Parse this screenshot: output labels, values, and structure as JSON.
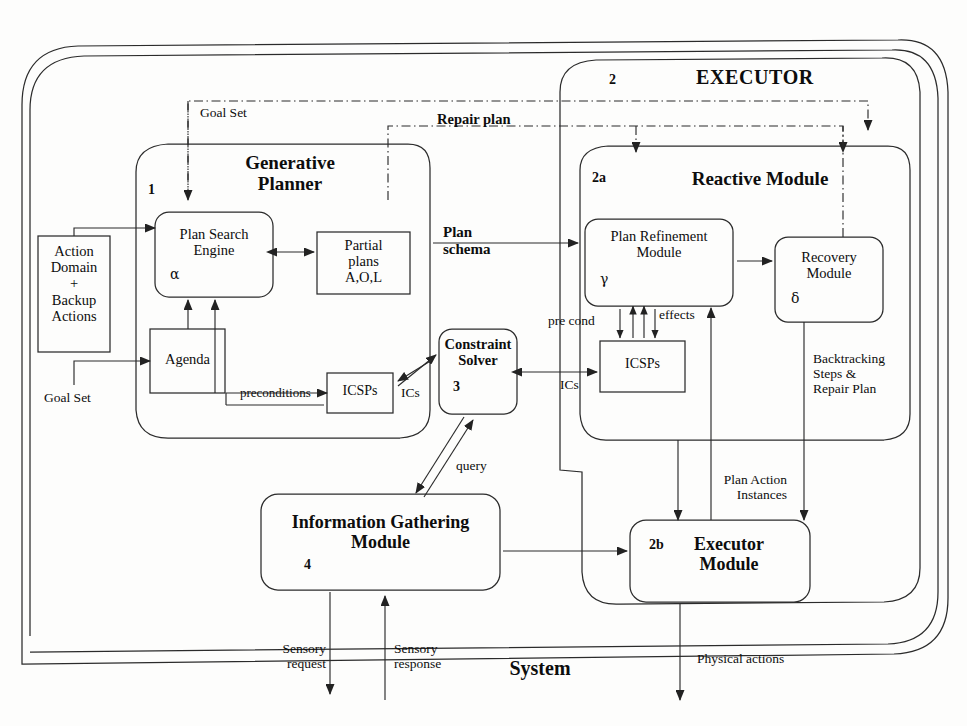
{
  "diagram": {
    "title": "System",
    "type": "architecture-block-diagram"
  },
  "containers": {
    "system": {
      "label": "System",
      "number": ""
    },
    "executor": {
      "label": "EXECUTOR",
      "number": "2"
    },
    "generative_planner": {
      "label": "Generative\nPlanner",
      "number": "1"
    },
    "reactive_module": {
      "label": "Reactive Module",
      "number": "2a"
    }
  },
  "boxes": {
    "action_domain": {
      "label": "Action\nDomain\n+\nBackup\nActions"
    },
    "plan_search_engine": {
      "label": "Plan Search\nEngine",
      "symbol": "α"
    },
    "partial_plans": {
      "label": "Partial\nplans\nA,O,L"
    },
    "agenda": {
      "label": "Agenda"
    },
    "icsps_planner": {
      "label": "ICSPs"
    },
    "constraint_solver": {
      "label": "Constraint\nSolver",
      "number": "3"
    },
    "plan_refinement": {
      "label": "Plan Refinement\nModule",
      "symbol": "γ"
    },
    "recovery_module": {
      "label": "Recovery\nModule",
      "symbol": "δ"
    },
    "icsps_reactive": {
      "label": "ICSPs"
    },
    "information_gathering": {
      "label": "Information Gathering\nModule",
      "number": "4"
    },
    "executor_module": {
      "label": "Executor\nModule",
      "number": "2b"
    }
  },
  "edge_labels": {
    "goal_set_top": "Goal Set",
    "repair_plan": "Repair plan",
    "goal_set_left": "Goal Set",
    "plan_schema": "Plan\nschema",
    "preconditions": "preconditions",
    "ics_planner": "ICs",
    "ics_reactive": "ICs",
    "query": "query",
    "pre_cond": "pre cond",
    "effects": "effects",
    "backtracking": "Backtracking\nSteps &\nRepair Plan",
    "plan_action_instances": "Plan Action\nInstances",
    "sensory_request": "Sensory\nrequest",
    "sensory_response": "Sensory\nresponse",
    "physical_actions": "Physical actions"
  },
  "colors": {
    "stroke": "#2b2b2b",
    "text": "#0d0d0d",
    "background": "#fdfdfc"
  }
}
